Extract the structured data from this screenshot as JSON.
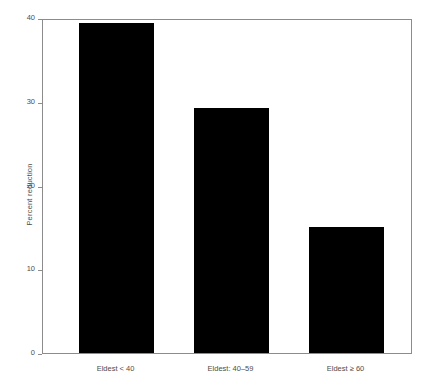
{
  "chart_data": {
    "type": "bar",
    "title": "",
    "subtitle": "",
    "xlabel": "",
    "ylabel": "Percent reduction",
    "categories": [
      "Eldest < 40",
      "Eldest: 40–59",
      "Eldest ≥ 60"
    ],
    "values": [
      39.4,
      29.3,
      15.1
    ],
    "ylim": [
      0,
      40
    ],
    "yticks": [
      0,
      10,
      20,
      30,
      40
    ],
    "ytick_labels": [
      "0",
      "10",
      "20",
      "30",
      "40"
    ],
    "grid": false,
    "legend": null,
    "bar_color": "#000000",
    "axis_color": "#8c8c8c",
    "text_color": "#4d4d4d",
    "background": "#ffffff"
  }
}
